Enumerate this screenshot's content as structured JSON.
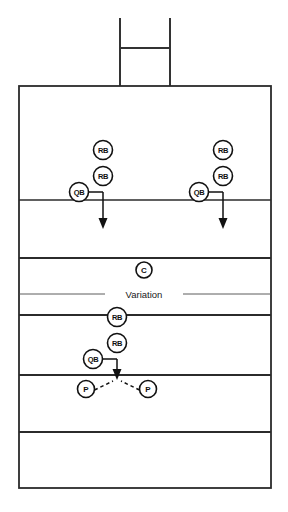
{
  "diagram": {
    "type": "football-play-diagram",
    "background_color": "#ffffff",
    "line_color": "#2b2b2b",
    "marker_fill": "#ffffff",
    "marker_stroke": "#111111",
    "divider": {
      "label": "Variation",
      "x": 144,
      "y": 294,
      "left_line": {
        "x1": 19,
        "x2": 105
      },
      "right_line": {
        "x1": 183,
        "x2": 271
      }
    },
    "goalpost": {
      "name": "goal-post",
      "left_upright_x": 120,
      "right_upright_x": 170,
      "top_y": 18,
      "bottom_y": 86,
      "crossbar_y": 48
    },
    "field": {
      "left": 19,
      "right": 271,
      "top": 86,
      "bottom": 488,
      "yard_lines": [
        200,
        258,
        315,
        375,
        432
      ]
    },
    "markers": [
      {
        "id": "rb-left-deep",
        "label": "RB",
        "cx": 103,
        "cy": 150,
        "r": 9.5,
        "size": "rb"
      },
      {
        "id": "rb-left-near",
        "label": "RB",
        "cx": 103,
        "cy": 176,
        "r": 9.5,
        "size": "rb"
      },
      {
        "id": "qb-left",
        "label": "QB",
        "cx": 79,
        "cy": 192,
        "r": 9.5,
        "size": "qb"
      },
      {
        "id": "rb-right-deep",
        "label": "RB",
        "cx": 223,
        "cy": 150,
        "r": 9.5,
        "size": "rb"
      },
      {
        "id": "rb-right-near",
        "label": "RB",
        "cx": 223,
        "cy": 176,
        "r": 9.5,
        "size": "rb"
      },
      {
        "id": "qb-right",
        "label": "QB",
        "cx": 199,
        "cy": 192,
        "r": 9.5,
        "size": "qb"
      },
      {
        "id": "c-center",
        "label": "C",
        "cx": 144,
        "cy": 270,
        "r": 8.0,
        "size": "c"
      },
      {
        "id": "rb-var-deep",
        "label": "RB",
        "cx": 117,
        "cy": 317,
        "r": 9.5,
        "size": "rb"
      },
      {
        "id": "rb-var-near",
        "label": "RB",
        "cx": 117,
        "cy": 343,
        "r": 9.5,
        "size": "rb"
      },
      {
        "id": "qb-var",
        "label": "QB",
        "cx": 93,
        "cy": 359,
        "r": 9.5,
        "size": "qb"
      },
      {
        "id": "p-left",
        "label": "P",
        "cx": 86,
        "cy": 389,
        "r": 8.5,
        "size": "p"
      },
      {
        "id": "p-right",
        "label": "P",
        "cx": 148,
        "cy": 389,
        "r": 8.5,
        "size": "p"
      }
    ],
    "routes": [
      {
        "id": "route-left",
        "handoff": "M 88.5 192 L 103 192",
        "stem": "M 103 192 L 103 220",
        "arrow_tip_y": 228,
        "arrow_x": 103
      },
      {
        "id": "route-right",
        "handoff": "M 208.5 192 L 223 192",
        "stem": "M 223 192 L 223 220",
        "arrow_tip_y": 228,
        "arrow_x": 223
      },
      {
        "id": "route-variation",
        "handoff": "M 102.5 359 L 117 359",
        "stem": "M 117 359 L 117 371",
        "arrow_tip_y": 379,
        "arrow_x": 117
      }
    ],
    "dashed_routes": [
      {
        "id": "pitch-left",
        "path": "M 94 391 L 114 381"
      },
      {
        "id": "pitch-right",
        "path": "M 140 391 L 121 381"
      }
    ]
  }
}
